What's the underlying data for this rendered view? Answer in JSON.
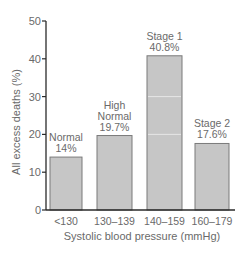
{
  "chart_data": {
    "type": "bar",
    "title": "",
    "xlabel": "Systolic blood pressure (mmHg)",
    "ylabel": "All excess deaths (%)",
    "ylim": [
      0,
      50
    ],
    "yticks": [
      0,
      10,
      20,
      30,
      40,
      50
    ],
    "categories": [
      "<130",
      "130–139",
      "140–159",
      "160–179"
    ],
    "values": [
      14,
      19.7,
      40.8,
      17.6
    ],
    "annotations": [
      {
        "lines": [
          "Normal",
          "14%"
        ]
      },
      {
        "lines": [
          "High",
          "Normal",
          "19.7%"
        ]
      },
      {
        "lines": [
          "Stage 1",
          "40.8%"
        ]
      },
      {
        "lines": [
          "Stage 2",
          "17.6%"
        ]
      }
    ],
    "grid": false,
    "legend": null
  },
  "colors": {
    "bar_fill": "#c6c6c6",
    "bar_stroke": "#7a7a7a",
    "axis": "#2a2a2a",
    "text": "#6a6a6a"
  }
}
